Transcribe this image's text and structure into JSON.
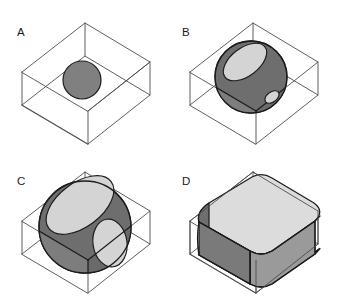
{
  "figure": {
    "background_color": "#ffffff",
    "width": 339,
    "height": 299,
    "panel_count": 4
  },
  "palette": {
    "box_edge": "#4d4d4d",
    "outline_dark": "#1c1c1c",
    "sphere_mid_gray": "#808080",
    "sphere_dark_gray": "#6e6e6e",
    "sphere_shadow_gray": "#5f5f5f",
    "cut_plane_light": "#d4d4d4",
    "cut_plane_lighter": "#dcdcdc",
    "face_front_gray": "#8a8a8a",
    "label_color": "#1a1a1a"
  },
  "panels": [
    {
      "id": "panel-a",
      "label": "A",
      "label_x": 17,
      "label_y": 36,
      "description": "Small sphere resting inside wireframe box, not touching the faces",
      "sphere": {
        "center_x": 82,
        "center_y": 80,
        "radius": 19,
        "fill": "#808080",
        "cuts": []
      }
    },
    {
      "id": "panel-b",
      "label": "B",
      "label_x": 182,
      "label_y": 36,
      "description": "Medium sphere intersecting the top face and right face of the box",
      "sphere": {
        "center_x": 251,
        "center_y": 77,
        "radius": 36,
        "fill": "#6e6e6e",
        "cuts": [
          {
            "name": "top-cut-ellipse",
            "fill": "#d4d4d4",
            "rx": 25,
            "ry": 14
          },
          {
            "name": "side-cut-ellipse",
            "fill": "#d4d4d4",
            "rx": 8,
            "ry": 5
          }
        ]
      }
    },
    {
      "id": "panel-c",
      "label": "C",
      "label_x": 17,
      "label_y": 185,
      "description": "Large sphere intersecting top and right faces with wide elliptical cuts",
      "sphere": {
        "center_x": 85,
        "center_y": 227,
        "radius": 46,
        "fill": "#6e6e6e",
        "cuts": [
          {
            "name": "top-cut-ellipse",
            "fill": "#d4d4d4",
            "rx": 39,
            "ry": 22
          },
          {
            "name": "side-cut-ellipse",
            "fill": "#d4d4d4",
            "rx": 17,
            "ry": 24
          }
        ]
      }
    },
    {
      "id": "panel-d",
      "label": "D",
      "label_x": 182,
      "label_y": 185,
      "description": "Sphere so large it fills the box, clipped to a rounded box solid",
      "sphere": {
        "center_x": 255,
        "center_y": 225,
        "radius": 78,
        "fill": "#8a8a8a",
        "cuts": [
          {
            "name": "top-face",
            "fill": "#dcdcdc"
          },
          {
            "name": "front-face",
            "fill": "#9a9a9a"
          },
          {
            "name": "left-rounded-face",
            "fill": "#6e6e6e"
          }
        ]
      }
    }
  ],
  "box_geometry": {
    "note": "Isometric wireframe box, same shape in all four panels",
    "top_back_left_x": 22,
    "top_back_left_y": 72,
    "visible_edges": 12
  }
}
